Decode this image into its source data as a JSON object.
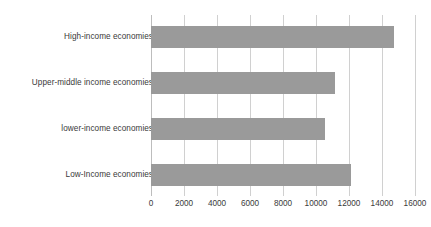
{
  "chart_data": {
    "type": "bar",
    "orientation": "horizontal",
    "title": "",
    "xlabel": "",
    "ylabel": "",
    "categories": [
      "High-income economies",
      "Upper-middle income economies",
      "lower-income economies",
      "Low-Income economies"
    ],
    "values": [
      14700,
      11150,
      10550,
      12150
    ],
    "xlim": [
      0,
      16000
    ],
    "xticks": [
      0,
      2000,
      4000,
      6000,
      8000,
      10000,
      12000,
      14000,
      16000
    ],
    "xtick_labels": [
      "0",
      "2000",
      "4000",
      "6000",
      "8000",
      "10000",
      "12000",
      "14000",
      "16000"
    ],
    "grid": true,
    "grid_axis": "x",
    "legend": false,
    "legend_position": "none",
    "bar_color": "#9a9a9a",
    "gridline_color": "#d0d0d0",
    "text_color": "#3a3a3a",
    "background_color": "#ffffff"
  }
}
